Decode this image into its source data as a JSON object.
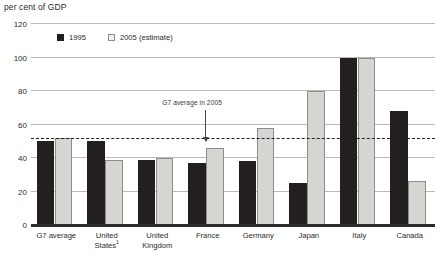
{
  "chart_data": {
    "type": "bar",
    "title": "",
    "ylabel": "per cent of GDP",
    "xlabel": "",
    "ylim": [
      0,
      120
    ],
    "yticks": [
      0,
      20,
      40,
      60,
      80,
      100,
      120
    ],
    "grid": true,
    "legend_position": "top-left-inside",
    "categories": [
      "G7 average",
      "United States",
      "United Kingdom",
      "France",
      "Germany",
      "Japan",
      "Italy",
      "Canada"
    ],
    "category_footnotes": [
      "",
      "1",
      "",
      "",
      "",
      "",
      "",
      ""
    ],
    "series": [
      {
        "name": "1995",
        "color": "#231f20",
        "values": [
          50,
          50,
          39,
          37,
          38,
          25,
          100,
          68
        ]
      },
      {
        "name": "2005 (estimate)",
        "color": "#d5d5d2",
        "values": [
          52,
          39,
          40,
          46,
          58,
          80,
          100,
          26
        ]
      }
    ],
    "reference_line": {
      "label": "G7 average in 2005",
      "value": 52,
      "style": "dashed"
    }
  },
  "legend": {
    "entries": [
      {
        "label": "1995"
      },
      {
        "label": "2005 (estimate)"
      }
    ]
  },
  "colors": {
    "series_1995": "#231f20",
    "series_2005": "#d5d5d2",
    "gridline": "#b9b9b9",
    "baseline": "#2b2b2b",
    "reference_line": "#1f1f1f"
  }
}
